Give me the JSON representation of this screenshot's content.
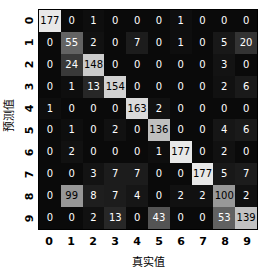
{
  "chart_data": {
    "type": "heatmap",
    "title": "",
    "xlabel": "真实值",
    "ylabel": "预测值",
    "categories": [
      "0",
      "1",
      "2",
      "3",
      "4",
      "5",
      "6",
      "7",
      "8",
      "9"
    ],
    "xticklabels": [
      "0",
      "1",
      "2",
      "3",
      "4",
      "5",
      "6",
      "7",
      "8",
      "9"
    ],
    "yticklabels": [
      "0",
      "1",
      "2",
      "3",
      "4",
      "5",
      "6",
      "7",
      "8",
      "9"
    ],
    "grid": false,
    "legend": "none",
    "colormap": "gray",
    "vmin": 0,
    "vmax": 177,
    "matrix": [
      [
        177,
        0,
        1,
        0,
        0,
        0,
        1,
        0,
        0,
        0
      ],
      [
        0,
        55,
        2,
        0,
        7,
        0,
        1,
        0,
        5,
        20
      ],
      [
        0,
        24,
        148,
        0,
        0,
        0,
        0,
        0,
        3,
        0
      ],
      [
        0,
        1,
        13,
        154,
        0,
        0,
        0,
        0,
        2,
        6
      ],
      [
        1,
        0,
        0,
        0,
        163,
        2,
        0,
        0,
        0,
        0
      ],
      [
        0,
        1,
        0,
        2,
        0,
        136,
        0,
        0,
        4,
        6
      ],
      [
        0,
        2,
        0,
        0,
        0,
        1,
        177,
        0,
        2,
        0
      ],
      [
        0,
        0,
        3,
        7,
        7,
        0,
        0,
        177,
        5,
        7
      ],
      [
        0,
        99,
        8,
        7,
        4,
        0,
        2,
        2,
        100,
        2
      ],
      [
        0,
        0,
        2,
        13,
        0,
        43,
        0,
        0,
        53,
        139
      ]
    ],
    "colors": {
      "background": "#ffffff",
      "cell_min": "#0a0a0a",
      "cell_max": "#e6e6e6",
      "text_light": "#ffffff",
      "text_dark": "#000000",
      "axis_text": "#000000"
    }
  }
}
